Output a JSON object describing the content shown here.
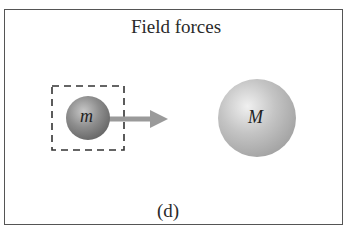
{
  "figure": {
    "title": "Field forces",
    "caption": "(d)",
    "small_mass": {
      "label": "m",
      "color": "#8a8a8a"
    },
    "large_mass": {
      "label": "M",
      "color": "#bdbdbd"
    },
    "arrow_color": "#9a9a9a",
    "border_color": "#555555"
  }
}
